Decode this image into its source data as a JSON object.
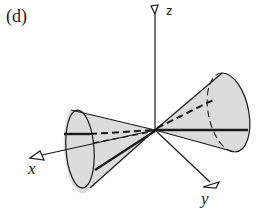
{
  "panel": {
    "label": "(d)"
  },
  "axes": {
    "x": {
      "label": "x"
    },
    "y": {
      "label": "y"
    },
    "z": {
      "label": "z"
    }
  },
  "figure": {
    "fill_color": "#dcdcdc",
    "stroke_color": "#1a1a1a"
  }
}
